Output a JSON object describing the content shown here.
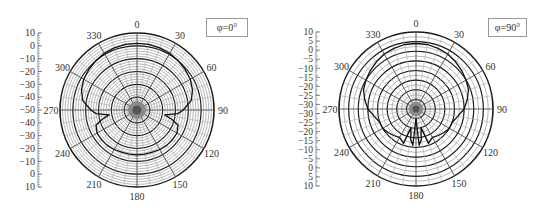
{
  "chart_data": [
    {
      "type": "polar",
      "title": "",
      "legend": "φ=0°",
      "angle_ticks": [
        "0",
        "30",
        "60",
        "90",
        "120",
        "150",
        "180",
        "210",
        "240",
        "270",
        "300",
        "330"
      ],
      "radial_axis_ticks": [
        "10",
        "0",
        "−10",
        "−20",
        "−30",
        "−40",
        "−50",
        "−40",
        "−30",
        "−20",
        "−10",
        "0",
        "10"
      ],
      "rlim": [
        -50,
        10
      ],
      "unit": "dB",
      "grid": true,
      "series": [
        {
          "name": "pattern φ=0°",
          "theta_deg": [
            0,
            10,
            20,
            30,
            40,
            50,
            60,
            70,
            80,
            90,
            95,
            100,
            105,
            110,
            120,
            130,
            140,
            150,
            160,
            170,
            180,
            190,
            200,
            210,
            220,
            230,
            240,
            250,
            255,
            260,
            265,
            270,
            280,
            290,
            300,
            310,
            320,
            330,
            340,
            350
          ],
          "r_db": [
            2,
            2,
            1.5,
            1,
            0,
            -1,
            -2,
            -4,
            -7,
            -14,
            -18,
            -28,
            -22,
            -16,
            -14,
            -14,
            -14,
            -14.5,
            -15,
            -15,
            -15,
            -15,
            -15,
            -14.5,
            -14,
            -14,
            -14,
            -16,
            -22,
            -28,
            -18,
            -14,
            -7,
            -4,
            -2,
            -1,
            0,
            1,
            1.5,
            2
          ]
        }
      ]
    },
    {
      "type": "polar",
      "title": "",
      "legend": "φ=90°",
      "angle_ticks": [
        "0",
        "30",
        "60",
        "90",
        "120",
        "150",
        "180",
        "210",
        "240",
        "270",
        "300",
        "330"
      ],
      "radial_axis_ticks": [
        "10",
        "5",
        "0",
        "−5",
        "−10",
        "−15",
        "−20",
        "−25",
        "−30",
        "−30",
        "−25",
        "−20",
        "−15",
        "−10",
        "−5",
        "0",
        "5",
        "10"
      ],
      "rlim": [
        -30,
        10
      ],
      "unit": "dB",
      "grid": true,
      "series": [
        {
          "name": "pattern φ=90°",
          "theta_deg": [
            0,
            10,
            20,
            30,
            40,
            50,
            60,
            70,
            80,
            90,
            100,
            110,
            120,
            130,
            140,
            150,
            160,
            165,
            170,
            175,
            180,
            185,
            190,
            195,
            200,
            210,
            220,
            230,
            240,
            250,
            260,
            270,
            280,
            290,
            300,
            310,
            320,
            330,
            340,
            350
          ],
          "r_db": [
            4,
            4,
            3.5,
            3,
            2,
            1,
            0,
            -1,
            -3,
            -5,
            -8,
            -10,
            -10,
            -11,
            -12,
            -13,
            -11,
            -20,
            -14,
            -11,
            -25,
            -11,
            -14,
            -20,
            -11,
            -13,
            -12,
            -11,
            -10,
            -10,
            -8,
            -5,
            -3,
            -1,
            0,
            1,
            2,
            3,
            3.5,
            4
          ]
        }
      ]
    }
  ]
}
